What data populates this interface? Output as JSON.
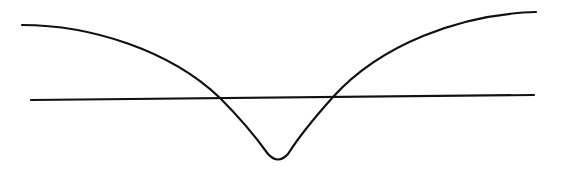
{
  "diagram": {
    "description": "V-shaped curve with rounded minimum crossed by a horizontal line",
    "stroke_color": "#111111",
    "background": "#ffffff",
    "horizontal_line": {
      "x1": 31,
      "y1": 100,
      "x2": 534,
      "y2": 95
    },
    "curve": {
      "start": [
        22,
        25
      ],
      "left_crossing": [
        220,
        98
      ],
      "minimum": [
        278,
        160
      ],
      "right_crossing": [
        333,
        97
      ],
      "end": [
        536,
        12
      ]
    }
  }
}
